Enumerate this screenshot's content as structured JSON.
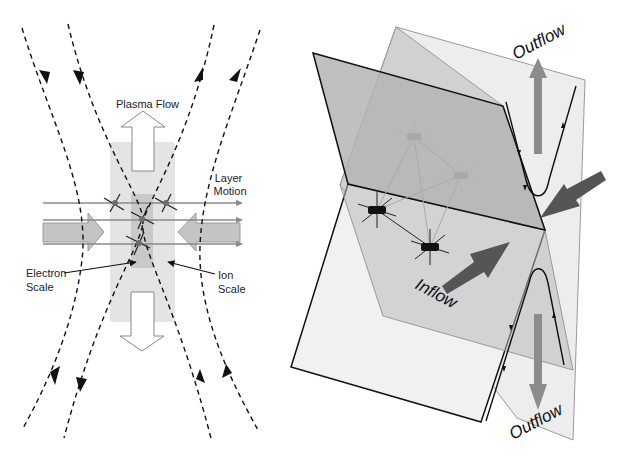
{
  "left_panel": {
    "title": "2D reconnection region (cross-section)",
    "labels": {
      "plasma_flow": "Plasma Flow",
      "layer_motion_line1": "Layer",
      "layer_motion_line2": "Motion",
      "electron_scale_line1": "Electron",
      "electron_scale_line2": "Scale",
      "ion_scale_line1": "Ion",
      "ion_scale_line2": "Scale"
    },
    "colors": {
      "ion_region": "#e4e4e4",
      "electron_region": "#c9c9c9",
      "inflow_arrow": "#c4c4c4",
      "outflow_arrow": "#ffffff",
      "field_lines": "#111111",
      "trajectory_lines": "#8a8a8a",
      "spacecraft_dots": "#6e6e6e"
    },
    "field_line_count": 4,
    "trajectory_line_count": 3,
    "spacecraft_count": 4
  },
  "right_panel": {
    "title": "3D reconnection geometry with spacecraft tetrahedron",
    "labels": {
      "outflow_top": "Outflow",
      "outflow_bottom": "Outflow",
      "inflow": "Inflow"
    },
    "colors": {
      "back_plane": "#ededed",
      "dark_plane": "#b9b9b9",
      "front_plane": "#efefef",
      "mid_plane": "#cfcfcf",
      "flow_arrows": "#8c8c8c",
      "inflow_arrows": "#555555",
      "spacecraft_near": "#111111",
      "spacecraft_far": "#a9a9a9"
    },
    "spacecraft_count": 4
  }
}
